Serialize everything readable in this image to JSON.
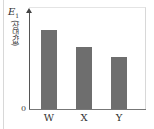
{
  "chart_data": {
    "type": "bar",
    "title": "",
    "xlabel": "",
    "ylabel": "E1 (상댓값)",
    "ylabel_main": "E",
    "ylabel_sub": "1",
    "ylabel_unit": "(상댓값)",
    "categories": [
      "W",
      "X",
      "Y"
    ],
    "values": [
      100,
      78,
      66
    ],
    "value_note": "relative values (no numeric scale shown); normalized to W = 100",
    "y_origin_label": "0",
    "ylim": [
      0,
      125
    ],
    "grid": false,
    "legend": null,
    "bar_color": "#6e6e6e"
  }
}
